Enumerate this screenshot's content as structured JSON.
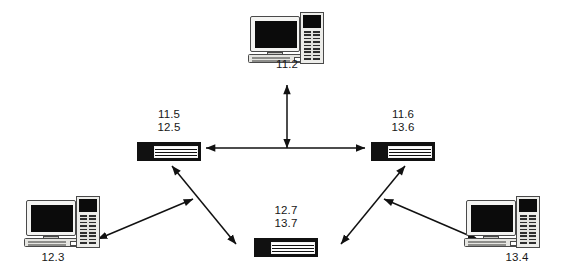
{
  "diagram": {
    "type": "network-topology",
    "background_color": "#ffffff",
    "line_color": "#111111",
    "nodes": [
      {
        "id": "host-top",
        "kind": "computer",
        "icon": "desktop-computer-icon",
        "labels": [
          "11.2"
        ],
        "label_text": "11.2",
        "x": 248,
        "y": 12
      },
      {
        "id": "switch-left",
        "kind": "switch",
        "icon": "network-switch-icon",
        "labels": [
          "11.5",
          "12.5"
        ],
        "label_text": "11.5\n12.5",
        "x": 137,
        "y": 142
      },
      {
        "id": "switch-right",
        "kind": "switch",
        "icon": "network-switch-icon",
        "labels": [
          "11.6",
          "13.6"
        ],
        "label_text": "11.6\n13.6",
        "x": 371,
        "y": 142
      },
      {
        "id": "switch-bottom",
        "kind": "switch",
        "icon": "network-switch-icon",
        "labels": [
          "12.7",
          "13.7"
        ],
        "label_text": "12.7\n13.7",
        "x": 254,
        "y": 238
      },
      {
        "id": "host-bottom-left",
        "kind": "computer",
        "icon": "desktop-computer-icon",
        "labels": [
          "12.3"
        ],
        "label_text": "12.3",
        "x": 24,
        "y": 196
      },
      {
        "id": "host-bottom-right",
        "kind": "computer",
        "icon": "desktop-computer-icon",
        "labels": [
          "13.4"
        ],
        "label_text": "13.4",
        "x": 464,
        "y": 196
      }
    ],
    "links": [
      {
        "from": "host-top",
        "to": "trunk-midpoint",
        "style": "double-arrow",
        "orientation": "vertical"
      },
      {
        "from": "switch-left",
        "to": "switch-right",
        "style": "double-arrow",
        "orientation": "horizontal"
      },
      {
        "from": "switch-left",
        "to": "host-bottom-left",
        "style": "double-arrow",
        "orientation": "diagonal"
      },
      {
        "from": "switch-left",
        "to": "switch-bottom",
        "style": "double-arrow",
        "orientation": "diagonal"
      },
      {
        "from": "switch-right",
        "to": "switch-bottom",
        "style": "double-arrow",
        "orientation": "diagonal"
      },
      {
        "from": "switch-right",
        "to": "host-bottom-right",
        "style": "double-arrow",
        "orientation": "diagonal"
      }
    ]
  }
}
